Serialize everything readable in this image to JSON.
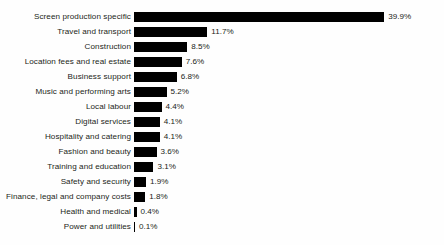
{
  "chart_data": {
    "type": "bar",
    "orientation": "horizontal",
    "title": "",
    "subtitle": "",
    "xlabel": "",
    "ylabel": "",
    "grid": false,
    "legend": false,
    "legend_position": "none",
    "xlim": [
      0,
      39.9
    ],
    "value_suffix": "%",
    "bar_color": "#000000",
    "background_color": "#fefefe",
    "text_color": "#231f20",
    "categories": [
      "Screen production specific",
      "Travel and transport",
      "Construction",
      "Location fees and real estate",
      "Business support",
      "Music and performing arts",
      "Local labour",
      "Digital services",
      "Hospitality and catering",
      "Fashion and beauty",
      "Training and education",
      "Safety and security",
      "Finance, legal and company costs",
      "Health and medical",
      "Power and utilities"
    ],
    "values": [
      39.9,
      11.7,
      8.5,
      7.6,
      6.8,
      5.2,
      4.4,
      4.1,
      4.1,
      3.6,
      3.1,
      1.9,
      1.8,
      0.4,
      0.1
    ],
    "value_labels": [
      "39.9%",
      "11.7%",
      "8.5%",
      "7.6%",
      "6.8%",
      "5.2%",
      "4.4%",
      "4.1%",
      "4.1%",
      "3.6%",
      "3.1%",
      "1.9%",
      "1.8%",
      "0.4%",
      "0.1%"
    ]
  },
  "layout": {
    "bar_origin_x": 134,
    "label_right_x": 131,
    "row_pitch": 15,
    "first_row_top": 9,
    "bar_height": 10,
    "px_per_percent": 6.27
  }
}
